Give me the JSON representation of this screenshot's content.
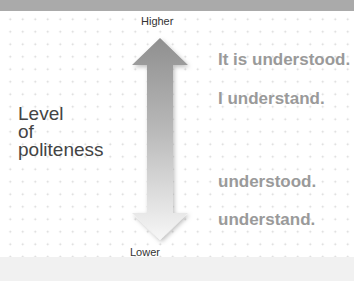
{
  "diagram": {
    "axis_label": "Level of politeness",
    "axis_label_lines": [
      "Level",
      "of",
      "politeness"
    ],
    "top_label": "Higher",
    "bottom_label": "Lower",
    "phrases": [
      "It is understood.",
      "I understand.",
      "understood.",
      "understand."
    ],
    "colors": {
      "top_bar": "#aaaaaa",
      "phrase_text": "#9a9a9a",
      "arrow_top": "#8f8f8f",
      "arrow_bottom": "#f5f5f5"
    }
  }
}
